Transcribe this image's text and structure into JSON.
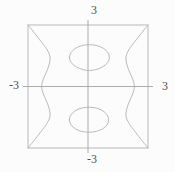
{
  "page": {
    "background": "#fcfcfc"
  },
  "colors": {
    "curve": "#b2b2b2",
    "frame": "#b2b2b2",
    "axis": "#a3a3a3",
    "label": "#4f4f4f"
  },
  "labels": {
    "top": "3",
    "bottom": "-3",
    "left": "-3",
    "right": "3"
  },
  "chart_data": {
    "type": "line",
    "subtype": "implicit-contour-plot",
    "title": "",
    "xlabel": "",
    "ylabel": "",
    "xlim": [
      -3,
      3
    ],
    "ylim": [
      -3,
      3
    ],
    "grid": false,
    "boxed_frame": true,
    "axes_through_origin": true,
    "axis_overshoot_px": 5,
    "axis_end_labels": {
      "x_min": "-3",
      "x_max": "3",
      "y_min": "-3",
      "y_max": "3"
    },
    "series": [
      {
        "name": "left-branch",
        "points": [
          [
            -3.0,
            3.0
          ],
          [
            -2.75,
            2.7
          ],
          [
            -2.35,
            2.2
          ],
          [
            -2.05,
            1.8
          ],
          [
            -1.9,
            1.44
          ],
          [
            -1.95,
            1.05
          ],
          [
            -2.1,
            0.66
          ],
          [
            -2.25,
            0.32
          ],
          [
            -2.32,
            0.0
          ],
          [
            -2.25,
            -0.32
          ],
          [
            -2.1,
            -0.66
          ],
          [
            -1.95,
            -1.05
          ],
          [
            -1.9,
            -1.44
          ],
          [
            -2.05,
            -1.8
          ],
          [
            -2.35,
            -2.2
          ],
          [
            -2.75,
            -2.7
          ],
          [
            -3.0,
            -3.0
          ]
        ]
      },
      {
        "name": "right-branch",
        "points": [
          [
            3.0,
            3.0
          ],
          [
            2.75,
            2.7
          ],
          [
            2.35,
            2.2
          ],
          [
            2.05,
            1.8
          ],
          [
            1.9,
            1.44
          ],
          [
            1.95,
            1.05
          ],
          [
            2.1,
            0.66
          ],
          [
            2.25,
            0.32
          ],
          [
            2.32,
            0.0
          ],
          [
            2.25,
            -0.32
          ],
          [
            2.1,
            -0.66
          ],
          [
            1.95,
            -1.05
          ],
          [
            1.9,
            -1.44
          ],
          [
            2.05,
            -1.8
          ],
          [
            2.35,
            -2.2
          ],
          [
            2.75,
            -2.7
          ],
          [
            3.0,
            -3.0
          ]
        ]
      },
      {
        "name": "upper-oval",
        "ellipse": {
          "cx": 0.07,
          "cy": 1.41,
          "rx": 1.0,
          "ry": 0.63,
          "bottom_taper": 0.38
        }
      },
      {
        "name": "lower-oval",
        "ellipse": {
          "cx": 0.05,
          "cy": -1.62,
          "rx": 0.98,
          "ry": 0.61,
          "bottom_taper": 0.52
        }
      }
    ]
  }
}
